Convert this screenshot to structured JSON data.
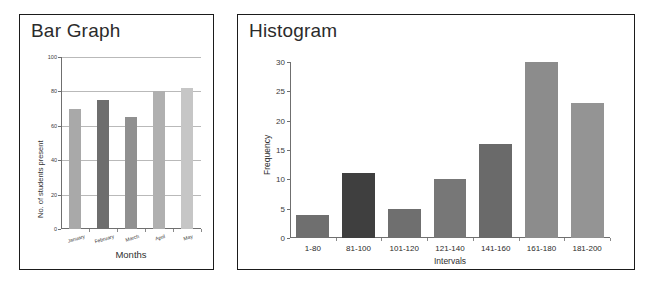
{
  "panels": [
    {
      "title": "Bar Graph"
    },
    {
      "title": "Histogram"
    }
  ],
  "chart_data": [
    {
      "type": "bar",
      "title": "Bar Graph",
      "categories": [
        "January",
        "February",
        "March",
        "April",
        "May"
      ],
      "values": [
        70,
        75,
        65,
        80,
        82
      ],
      "xlabel": "Months",
      "ylabel": "No. of students present",
      "ylim": [
        0,
        100
      ],
      "yticks": [
        0,
        20,
        40,
        60,
        80,
        100
      ],
      "grid": true,
      "legend": "none",
      "bar_colors": [
        "#a9a9a9",
        "#6e6e6e",
        "#909090",
        "#b0b0b0",
        "#c6c6c6"
      ]
    },
    {
      "type": "bar",
      "title": "Histogram",
      "categories": [
        "1-80",
        "81-100",
        "101-120",
        "121-140",
        "141-160",
        "161-180",
        "181-200"
      ],
      "values": [
        4,
        11,
        5,
        10,
        16,
        30,
        23
      ],
      "xlabel": "Intervals",
      "ylabel": "Frequency",
      "ylim": [
        0,
        30
      ],
      "yticks": [
        0,
        5,
        10,
        15,
        20,
        25,
        30
      ],
      "grid": false,
      "legend": "none",
      "bar_colors": [
        "#6f6f6f",
        "#3f3f3f",
        "#6f6f6f",
        "#777777",
        "#6a6a6a",
        "#8c8c8c",
        "#949494"
      ]
    }
  ]
}
